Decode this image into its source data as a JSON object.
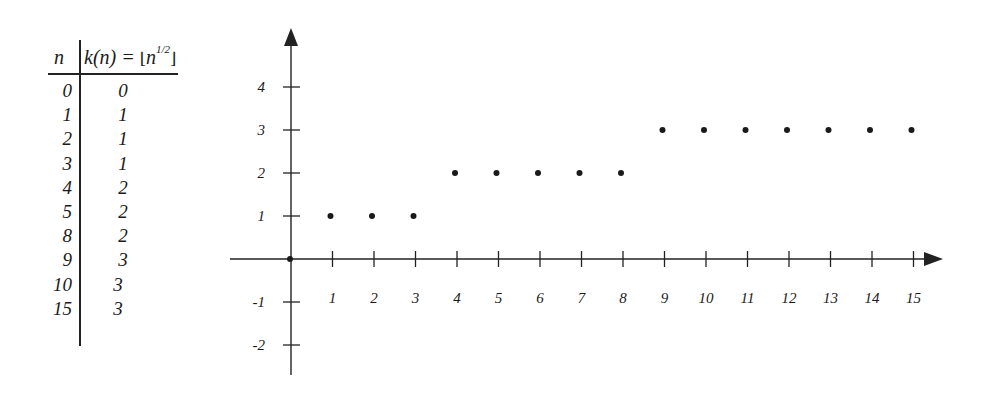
{
  "table": {
    "header_n": "n",
    "header_k_prefix": "k(n) = ",
    "header_k_open": "⌊",
    "header_k_base": "n",
    "header_k_exp": "1/2",
    "header_k_close": "⌋",
    "rows": [
      {
        "n": "0",
        "k": "0"
      },
      {
        "n": "1",
        "k": "1"
      },
      {
        "n": "2",
        "k": "1"
      },
      {
        "n": "3",
        "k": "1"
      },
      {
        "n": "4",
        "k": "2"
      },
      {
        "n": "5",
        "k": "2"
      },
      {
        "n": "8",
        "k": "2"
      },
      {
        "n": "9",
        "k": "3"
      },
      {
        "n": "10",
        "k": "3"
      },
      {
        "n": "15",
        "k": "3"
      }
    ]
  },
  "chart_data": {
    "type": "scatter",
    "title": "",
    "xlabel": "n",
    "ylabel": "k(n) = floor(n^(1/2))",
    "x": [
      0,
      1,
      2,
      3,
      4,
      5,
      6,
      7,
      8,
      9,
      10,
      11,
      12,
      13,
      14,
      15
    ],
    "values": [
      0,
      1,
      1,
      1,
      2,
      2,
      2,
      2,
      2,
      3,
      3,
      3,
      3,
      3,
      3,
      3
    ],
    "x_tick_labels": [
      "1",
      "2",
      "3",
      "4",
      "5",
      "6",
      "7",
      "8",
      "9",
      "10",
      "11",
      "12",
      "13",
      "14",
      "15"
    ],
    "y_tick_labels": [
      "4",
      "3",
      "2",
      "1",
      "-1",
      "-2"
    ],
    "y_ticks": [
      4,
      3,
      2,
      1,
      -1,
      -2
    ],
    "xlim": [
      -1.5,
      15.7
    ],
    "ylim": [
      -2.8,
      5.5
    ],
    "grid": false,
    "legend": null,
    "colors": {
      "axis": "#222222",
      "points": "#1a1a1a"
    }
  }
}
